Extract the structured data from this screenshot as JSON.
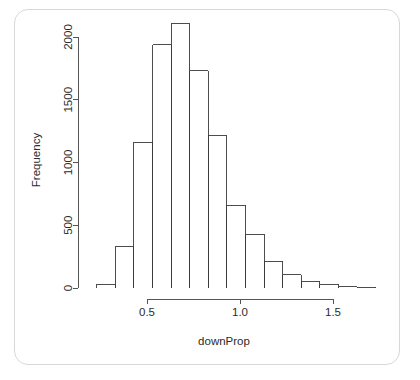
{
  "card": {
    "background_color": "#ffffff",
    "border_color": "#d8d8d8"
  },
  "chart_data": {
    "type": "bar",
    "subtype": "histogram",
    "title": "",
    "xlabel": "downProp",
    "ylabel": "Frequency",
    "xlim": [
      0.23,
      1.73
    ],
    "ylim": [
      0,
      2100
    ],
    "grid": false,
    "legend": "none",
    "bin_width": 0.1,
    "bin_edges": [
      0.23,
      0.33,
      0.43,
      0.53,
      0.63,
      0.73,
      0.83,
      0.93,
      1.03,
      1.13,
      1.23,
      1.33,
      1.43,
      1.53,
      1.63,
      1.73
    ],
    "categories": [
      "0.23-0.33",
      "0.33-0.43",
      "0.43-0.53",
      "0.53-0.63",
      "0.63-0.73",
      "0.73-0.83",
      "0.83-0.93",
      "0.93-1.03",
      "1.03-1.13",
      "1.13-1.23",
      "1.23-1.33",
      "1.33-1.43",
      "1.43-1.53",
      "1.53-1.63",
      "1.63-1.73"
    ],
    "values": [
      30,
      330,
      1160,
      1940,
      2105,
      1730,
      1215,
      660,
      430,
      215,
      105,
      55,
      25,
      10,
      5
    ],
    "x_ticks": [
      0.5,
      1.0,
      1.5
    ],
    "x_tick_labels": [
      "0.5",
      "1.0",
      "1.5"
    ],
    "y_ticks": [
      0,
      500,
      1000,
      1500,
      2000
    ],
    "y_tick_labels": [
      "0",
      "500",
      "1000",
      "1500",
      "2000"
    ],
    "bar_fill": "none",
    "bar_stroke": "#3a3a3a",
    "axis_color": "#555555"
  }
}
